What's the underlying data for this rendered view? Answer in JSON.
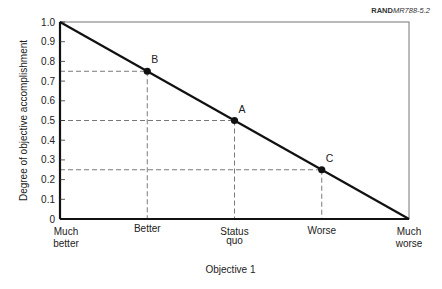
{
  "credit": {
    "org": "RAND",
    "code": "MR788-5.2"
  },
  "chart_data": {
    "type": "line",
    "title": "",
    "xlabel": "Objective 1",
    "ylabel": "Degree of objective accomplishment",
    "categories": [
      "Much better",
      "Better",
      "Status quo",
      "Worse",
      "Much worse"
    ],
    "x_positions": [
      0,
      1,
      2,
      3,
      4
    ],
    "ylim": [
      0,
      1.0
    ],
    "yticks": [
      "0",
      "0.1",
      "0.2",
      "0.3",
      "0.4",
      "0.5",
      "0.6",
      "0.7",
      "0.8",
      "0.9",
      "1.0"
    ],
    "series": [
      {
        "name": "Utility curve",
        "x": [
          0,
          4
        ],
        "y": [
          1.0,
          0.0
        ]
      }
    ],
    "points": [
      {
        "label": "B",
        "x": 1,
        "y": 0.75
      },
      {
        "label": "A",
        "x": 2,
        "y": 0.5
      },
      {
        "label": "C",
        "x": 3,
        "y": 0.25
      }
    ],
    "grid": false,
    "legend": "none",
    "reference_lines": "dashed lines from each point to both axes"
  }
}
